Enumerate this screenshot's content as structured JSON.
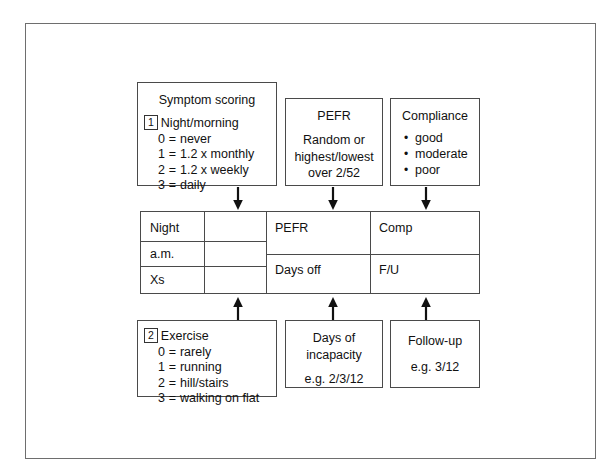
{
  "diagram": {
    "boxes": {
      "symptom": {
        "title": "Symptom scoring",
        "marker": "1",
        "heading": "Night/morning",
        "options": [
          {
            "score": "0",
            "eq": "=",
            "label": "never"
          },
          {
            "score": "1",
            "eq": "=",
            "label": "1.2 x monthly"
          },
          {
            "score": "2",
            "eq": "=",
            "label": "1.2 x weekly"
          },
          {
            "score": "3",
            "eq": "=",
            "label": "daily"
          }
        ]
      },
      "pefr": {
        "title": "PEFR",
        "line1": "Random or",
        "line2": "highest/lowest",
        "line3": "over 2/52"
      },
      "compliance": {
        "title": "Compliance",
        "items": [
          "good",
          "moderate",
          "poor"
        ]
      },
      "exercise": {
        "marker": "2",
        "heading": "Exercise",
        "options": [
          {
            "score": "0",
            "eq": "=",
            "label": "rarely"
          },
          {
            "score": "1",
            "eq": "=",
            "label": "running"
          },
          {
            "score": "2",
            "eq": "=",
            "label": "hill/stairs"
          },
          {
            "score": "3",
            "eq": "=",
            "label": "walking on flat"
          }
        ]
      },
      "incapacity": {
        "line1": "Days of",
        "line2": "incapacity",
        "example": "e.g. 2/3/12"
      },
      "followup": {
        "line1": "Follow-up",
        "example": "e.g. 3/12"
      }
    },
    "record_table": {
      "left_rows": [
        "Night",
        "a.m.",
        "Xs"
      ],
      "right_cells": [
        {
          "row": 0,
          "col": 0,
          "label": "PEFR"
        },
        {
          "row": 0,
          "col": 1,
          "label": "Comp"
        },
        {
          "row": 1,
          "col": 0,
          "label": "Days off"
        },
        {
          "row": 1,
          "col": 1,
          "label": "F/U"
        }
      ]
    },
    "colors": {
      "ink": "#111111",
      "rule": "#4a4a4a",
      "frame": "#6e6e6e",
      "paper": "#ffffff"
    }
  }
}
